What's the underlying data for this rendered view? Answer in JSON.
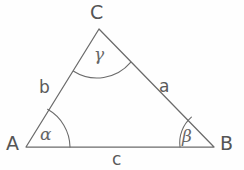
{
  "figure": {
    "kind": "triangle-diagram",
    "stroke_color": "#6b6b6b",
    "text_color": "#585858",
    "background_color": "#fefefe",
    "vertices": [
      {
        "name": "A",
        "label": "A",
        "x": 26,
        "y": 147
      },
      {
        "name": "B",
        "label": "B",
        "x": 214,
        "y": 147
      },
      {
        "name": "C",
        "label": "C",
        "x": 99,
        "y": 29
      }
    ],
    "sides": [
      {
        "name": "side-a",
        "label": "a",
        "between": "C-B"
      },
      {
        "name": "side-b",
        "label": "b",
        "between": "A-C"
      },
      {
        "name": "side-c",
        "label": "c",
        "between": "A-B"
      }
    ],
    "angles": [
      {
        "name": "angle-alpha",
        "label": "α",
        "at": "A"
      },
      {
        "name": "angle-beta",
        "label": "β",
        "at": "B"
      },
      {
        "name": "angle-gamma",
        "label": "γ",
        "at": "C"
      }
    ]
  }
}
